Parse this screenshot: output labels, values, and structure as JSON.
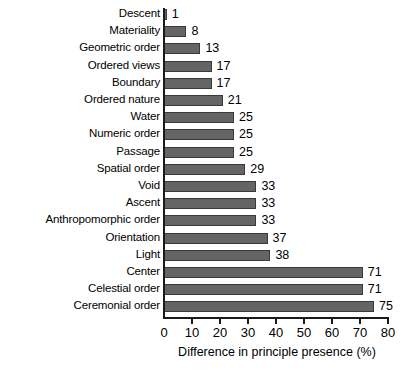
{
  "chart_data": {
    "type": "bar",
    "orientation": "horizontal",
    "title": "",
    "xlabel": "Difference in principle presence (%)",
    "ylabel": "",
    "xlim": [
      0,
      80
    ],
    "xticks": [
      0,
      10,
      20,
      30,
      40,
      50,
      60,
      70,
      80
    ],
    "xtick_labels": [
      "0",
      "10",
      "20",
      "30",
      "40",
      "50",
      "60",
      "70",
      "80"
    ],
    "grid": false,
    "legend": null,
    "bar_color": "#656565",
    "bar_edge_color": "#3a3a3a",
    "axis_color": "#1a1a1a",
    "categories": [
      "Descent",
      "Materiality",
      "Geometric order",
      "Ordered views",
      "Boundary",
      "Ordered nature",
      "Water",
      "Numeric order",
      "Passage",
      "Spatial order",
      "Void",
      "Ascent",
      "Anthropomorphic order",
      "Orientation",
      "Light",
      "Center",
      "Celestial order",
      "Ceremonial order"
    ],
    "values": [
      1,
      8,
      13,
      17,
      17,
      21,
      25,
      25,
      25,
      29,
      33,
      33,
      33,
      37,
      38,
      71,
      71,
      75
    ],
    "value_labels": [
      "1",
      "8",
      "13",
      "17",
      "17",
      "21",
      "25",
      "25",
      "25",
      "29",
      "33",
      "33",
      "33",
      "37",
      "38",
      "71",
      "71",
      "75"
    ]
  }
}
